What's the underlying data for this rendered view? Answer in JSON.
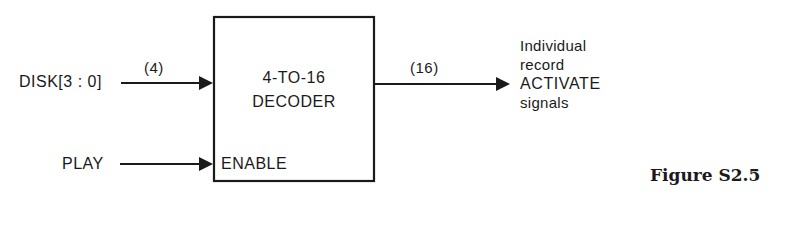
{
  "diagram": {
    "inputs": [
      {
        "label": "DISK[3 : 0]",
        "bus_width": "(4)"
      },
      {
        "label": "PLAY"
      }
    ],
    "block": {
      "title_line1": "4-TO-16",
      "title_line2": "DECODER",
      "enable_port": "ENABLE"
    },
    "output": {
      "bus_width": "(16)",
      "description_lines": [
        "Individual",
        "record",
        "ACTIVATE",
        "signals"
      ]
    },
    "caption": "Figure S2.5",
    "colors": {
      "ink": "#1a1a1a",
      "background": "#ffffff"
    }
  }
}
